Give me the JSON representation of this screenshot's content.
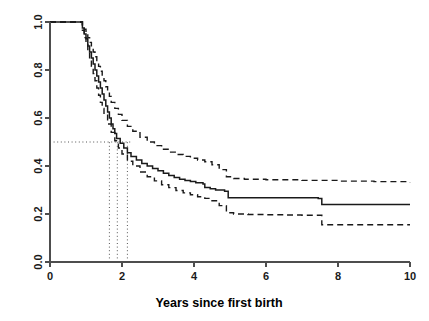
{
  "chart_data": {
    "type": "line",
    "subtype": "kaplan-meier-survival",
    "title": "",
    "subtitle": "",
    "xlabel": "Years since first birth",
    "ylabel": "",
    "xlim": [
      0,
      10
    ],
    "ylim": [
      0,
      1
    ],
    "grid": false,
    "legend": null,
    "xticks": [
      0,
      2,
      4,
      6,
      8,
      10
    ],
    "xtick_labels": [
      "0",
      "2",
      "4",
      "6",
      "8",
      "10"
    ],
    "yticks": [
      0.0,
      0.2,
      0.4,
      0.6,
      0.8,
      1.0
    ],
    "ytick_labels": [
      "0.0",
      "0.2",
      "0.4",
      "0.6",
      "0.8",
      "1.0"
    ],
    "series": [
      {
        "name": "Survival estimate",
        "style": "solid",
        "color": "#1a1a1a",
        "x": [
          0,
          0.85,
          0.9,
          0.95,
          1.0,
          1.05,
          1.1,
          1.15,
          1.2,
          1.25,
          1.3,
          1.35,
          1.4,
          1.45,
          1.5,
          1.55,
          1.6,
          1.65,
          1.7,
          1.75,
          1.8,
          1.85,
          1.95,
          2.05,
          2.15,
          2.25,
          2.4,
          2.55,
          2.7,
          2.85,
          3.0,
          3.15,
          3.3,
          3.45,
          3.6,
          3.75,
          3.9,
          4.05,
          4.25,
          4.3,
          4.45,
          4.6,
          4.85,
          4.95,
          7.45,
          7.55,
          10.0
        ],
        "y": [
          1.0,
          1.0,
          0.975,
          0.95,
          0.93,
          0.9,
          0.875,
          0.85,
          0.825,
          0.8,
          0.775,
          0.75,
          0.725,
          0.7,
          0.675,
          0.65,
          0.625,
          0.6,
          0.575,
          0.555,
          0.535,
          0.515,
          0.495,
          0.475,
          0.455,
          0.44,
          0.425,
          0.41,
          0.4,
          0.39,
          0.38,
          0.37,
          0.36,
          0.352,
          0.345,
          0.34,
          0.335,
          0.33,
          0.325,
          0.31,
          0.305,
          0.3,
          0.295,
          0.268,
          0.265,
          0.24,
          0.24
        ]
      },
      {
        "name": "Upper 95% confidence limit",
        "style": "dashed",
        "color": "#1a1a1a",
        "x": [
          0,
          0.85,
          0.9,
          0.95,
          1.0,
          1.05,
          1.1,
          1.15,
          1.2,
          1.25,
          1.3,
          1.35,
          1.4,
          1.45,
          1.5,
          1.55,
          1.6,
          1.65,
          1.7,
          1.8,
          1.9,
          2.0,
          2.15,
          2.3,
          2.5,
          2.7,
          2.9,
          3.1,
          3.3,
          3.5,
          3.7,
          3.9,
          4.1,
          4.3,
          4.5,
          4.7,
          4.9,
          5.1,
          5.4,
          6.0,
          7.0,
          8.0,
          9.0,
          10.0
        ],
        "y": [
          1.0,
          1.0,
          0.985,
          0.97,
          0.955,
          0.935,
          0.915,
          0.895,
          0.875,
          0.855,
          0.835,
          0.815,
          0.795,
          0.775,
          0.755,
          0.73,
          0.71,
          0.69,
          0.665,
          0.64,
          0.615,
          0.59,
          0.565,
          0.545,
          0.52,
          0.5,
          0.485,
          0.47,
          0.458,
          0.448,
          0.44,
          0.432,
          0.425,
          0.418,
          0.405,
          0.385,
          0.355,
          0.348,
          0.345,
          0.343,
          0.34,
          0.337,
          0.335,
          0.332
        ]
      },
      {
        "name": "Lower 95% confidence limit",
        "style": "dashed",
        "color": "#1a1a1a",
        "x": [
          0,
          0.85,
          0.9,
          0.95,
          1.0,
          1.05,
          1.1,
          1.15,
          1.2,
          1.25,
          1.3,
          1.35,
          1.4,
          1.45,
          1.5,
          1.6,
          1.7,
          1.8,
          1.9,
          2.0,
          2.15,
          2.3,
          2.5,
          2.7,
          2.9,
          3.1,
          3.3,
          3.5,
          3.7,
          3.9,
          4.1,
          4.3,
          4.5,
          4.7,
          4.9,
          5.1,
          5.5,
          6.0,
          6.5,
          7.0,
          7.45,
          7.55,
          8.5,
          9.5,
          10.0
        ],
        "y": [
          1.0,
          1.0,
          0.965,
          0.935,
          0.905,
          0.875,
          0.845,
          0.815,
          0.785,
          0.755,
          0.725,
          0.695,
          0.665,
          0.64,
          0.615,
          0.575,
          0.54,
          0.505,
          0.475,
          0.45,
          0.42,
          0.4,
          0.375,
          0.355,
          0.338,
          0.322,
          0.31,
          0.298,
          0.288,
          0.28,
          0.272,
          0.265,
          0.255,
          0.235,
          0.205,
          0.2,
          0.198,
          0.197,
          0.196,
          0.195,
          0.195,
          0.155,
          0.155,
          0.155,
          0.155
        ]
      }
    ],
    "reference_lines": [
      {
        "name": "median-survival-horizontal",
        "orientation": "horizontal",
        "value": 0.5,
        "style": "dotted",
        "x_from": 0,
        "x_to": 2.3
      },
      {
        "name": "median-lower-ci-vertical",
        "orientation": "vertical",
        "value": 1.65,
        "style": "dotted",
        "y_from": 0,
        "y_to": 0.5
      },
      {
        "name": "median-estimate-vertical",
        "orientation": "vertical",
        "value": 1.87,
        "style": "dotted",
        "y_from": 0,
        "y_to": 0.5
      },
      {
        "name": "median-upper-ci-vertical",
        "orientation": "vertical",
        "value": 2.15,
        "style": "dotted",
        "y_from": 0,
        "y_to": 0.5
      }
    ],
    "annotations": []
  },
  "axes": {
    "x_title": "Years since first birth",
    "y_title": ""
  },
  "colors": {
    "curve": "#1a1a1a",
    "axis": "#4d4d4d",
    "reference": "#555555",
    "background": "#ffffff"
  }
}
